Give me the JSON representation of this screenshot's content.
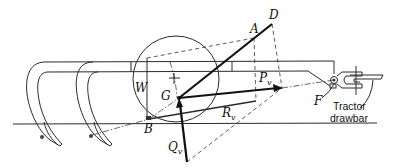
{
  "figure": {
    "points": {
      "A": {
        "label": "A",
        "x": 254,
        "y": 38
      },
      "D": {
        "label": "D",
        "x": 272,
        "y": 24
      },
      "G": {
        "label": "G",
        "x": 179,
        "y": 98
      },
      "B": {
        "label": "B",
        "x": 149,
        "y": 119
      },
      "F": {
        "label": "F",
        "x": 334,
        "y": 80
      },
      "W": {
        "label": "W"
      }
    },
    "forces": {
      "Pv": {
        "main": "P",
        "sub": "v"
      },
      "Rv": {
        "main": "R",
        "sub": "v"
      },
      "Qv": {
        "main": "Q",
        "sub": "v"
      }
    },
    "caption": {
      "line1": "Tractor",
      "line2": "drawbar"
    },
    "colors": {
      "ink": "#111111",
      "background": "#ffffff"
    }
  }
}
